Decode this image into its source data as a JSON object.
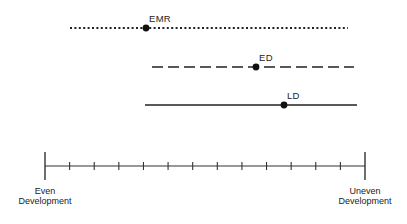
{
  "diagram": {
    "type": "development-continuum",
    "series": [
      {
        "name": "EMR",
        "label": "EMR",
        "line_style": "dotted",
        "x_start": 70,
        "x_end": 348,
        "y": 28,
        "marker_x": 146,
        "label_x": 149,
        "label_y": 14
      },
      {
        "name": "ED",
        "label": "ED",
        "line_style": "dashed",
        "x_start": 152,
        "x_end": 354,
        "y": 67,
        "marker_x": 256,
        "label_x": 259,
        "label_y": 53
      },
      {
        "name": "LD",
        "label": "LD",
        "line_style": "solid",
        "x_start": 145,
        "x_end": 357,
        "y": 105,
        "marker_x": 284,
        "label_x": 287,
        "label_y": 91
      }
    ],
    "axis": {
      "x_start": 45,
      "x_end": 365,
      "y": 166,
      "minor_tick_count": 12,
      "left_label_line1": "Even",
      "left_label_line2": "Development",
      "right_label_line1": "Uneven",
      "right_label_line2": "Development"
    },
    "colors": {
      "ink": "#222222",
      "background": "#ffffff"
    }
  }
}
